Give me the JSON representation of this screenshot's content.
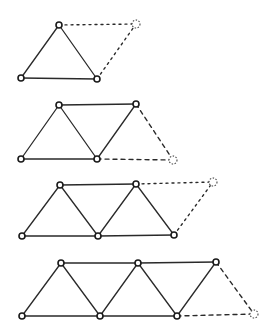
{
  "diagram": {
    "stroke_color": "#2a2a2a",
    "background": "#ffffff",
    "figures": [
      {
        "id": "stage-1",
        "nodes": [
          [
            59,
            25
          ],
          [
            21,
            78
          ],
          [
            97,
            79
          ]
        ],
        "edges": [
          [
            0,
            1
          ],
          [
            0,
            2
          ],
          [
            1,
            2
          ]
        ],
        "ghost_node": [
          136,
          24
        ],
        "ghost_edges": [
          [
            [
              59,
              25
            ],
            [
              136,
              24
            ]
          ],
          [
            [
              97,
              79
            ],
            [
              136,
              24
            ]
          ]
        ],
        "ghost_style": "dotted"
      },
      {
        "id": "stage-2",
        "nodes": [
          [
            59,
            105
          ],
          [
            136,
            104
          ],
          [
            21,
            159
          ],
          [
            97,
            159
          ]
        ],
        "edges": [
          [
            0,
            2
          ],
          [
            0,
            3
          ],
          [
            0,
            1
          ],
          [
            1,
            3
          ],
          [
            2,
            3
          ]
        ],
        "ghost_node": [
          173,
          160
        ],
        "ghost_edges": [
          [
            [
              136,
              104
            ],
            [
              173,
              160
            ]
          ],
          [
            [
              97,
              159
            ],
            [
              173,
              160
            ]
          ]
        ],
        "ghost_style": "dashed"
      },
      {
        "id": "stage-3",
        "nodes": [
          [
            60,
            185
          ],
          [
            136,
            184
          ],
          [
            22,
            236
          ],
          [
            98,
            236
          ],
          [
            174,
            235
          ]
        ],
        "edges": [
          [
            0,
            2
          ],
          [
            0,
            3
          ],
          [
            0,
            1
          ],
          [
            1,
            3
          ],
          [
            1,
            4
          ],
          [
            2,
            3
          ],
          [
            3,
            4
          ]
        ],
        "ghost_node": [
          213,
          182
        ],
        "ghost_edges": [
          [
            [
              136,
              184
            ],
            [
              213,
              182
            ]
          ],
          [
            [
              174,
              235
            ],
            [
              213,
              182
            ]
          ]
        ],
        "ghost_style": "dotted"
      },
      {
        "id": "stage-4",
        "nodes": [
          [
            61,
            263
          ],
          [
            138,
            263
          ],
          [
            216,
            262
          ],
          [
            22,
            316
          ],
          [
            100,
            316
          ],
          [
            177,
            316
          ]
        ],
        "edges": [
          [
            0,
            3
          ],
          [
            0,
            4
          ],
          [
            0,
            1
          ],
          [
            1,
            4
          ],
          [
            1,
            5
          ],
          [
            1,
            2
          ],
          [
            2,
            5
          ],
          [
            3,
            4
          ],
          [
            4,
            5
          ]
        ],
        "ghost_node": [
          254,
          314
        ],
        "ghost_edges": [
          [
            [
              216,
              262
            ],
            [
              254,
              314
            ]
          ],
          [
            [
              177,
              316
            ],
            [
              254,
              314
            ]
          ]
        ],
        "ghost_style": "dashed"
      }
    ]
  }
}
